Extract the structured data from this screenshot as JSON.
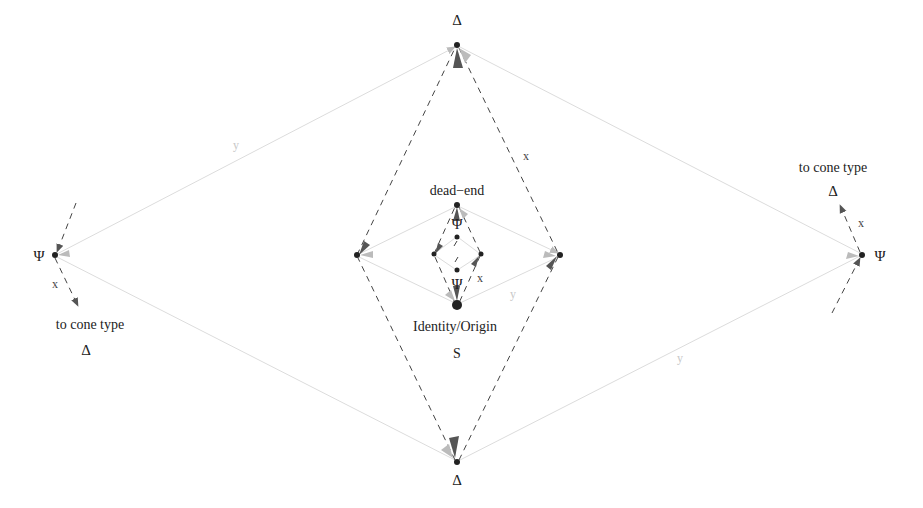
{
  "diagram": {
    "nodes": [
      {
        "id": "top_delta",
        "label": "Δ",
        "x": 457,
        "y": 45
      },
      {
        "id": "bottom_delta",
        "label": "Δ",
        "x": 457,
        "y": 462
      },
      {
        "id": "left_psi",
        "label": "Ψ",
        "x": 55,
        "y": 255
      },
      {
        "id": "right_psi",
        "label": "Ψ",
        "x": 862,
        "y": 255
      },
      {
        "id": "mid_left",
        "label": "",
        "x": 357,
        "y": 255
      },
      {
        "id": "mid_right",
        "label": "",
        "x": 560,
        "y": 255
      },
      {
        "id": "dead_end",
        "label": "dead−end",
        "x": 457,
        "y": 205
      },
      {
        "id": "inner_top",
        "label": "Ψ",
        "x": 457,
        "y": 237
      },
      {
        "id": "inner_left",
        "label": "",
        "x": 434,
        "y": 254
      },
      {
        "id": "inner_right",
        "label": "",
        "x": 481,
        "y": 254
      },
      {
        "id": "inner_bottom",
        "label": "Ψ",
        "x": 457,
        "y": 270
      },
      {
        "id": "origin",
        "label": "Identity/Origin",
        "sublabel": "S",
        "x": 457,
        "y": 305
      }
    ],
    "edge_legend": {
      "dashed": "x",
      "solid": "y"
    },
    "labels": {
      "top_delta": "Δ",
      "bottom_delta": "Δ",
      "left_psi": "Ψ",
      "right_psi": "Ψ",
      "dead_end": "dead−end",
      "inner_top_psi": "Ψ",
      "inner_bottom_psi": "Ψ",
      "origin": "Identity/Origin",
      "origin_sub": "S",
      "left_cone_text": "to cone type",
      "left_cone_delta": "Δ",
      "right_cone_text": "to cone type",
      "right_cone_delta": "Δ",
      "x_top_right": "x",
      "x_inner": "x",
      "x_left": "x",
      "x_right": "x",
      "y_top_left": "y",
      "y_inner": "y",
      "y_bottom_right": "y"
    },
    "colors": {
      "dashed_edge": "#444444",
      "solid_edge": "#d8d8d8",
      "node": "#222222",
      "arrow_dark": "#555555",
      "arrow_light": "#bbbbbb"
    }
  }
}
